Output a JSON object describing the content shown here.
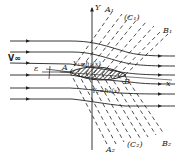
{
  "figure": {
    "labels": {
      "freestream": "V∞",
      "angle": "ε",
      "leading_edge": "A",
      "trailing_edge": "B",
      "x_axis": "x",
      "y_axis": "Y",
      "upper_surface": "Y₁=h₁(x)",
      "lower_surface": "Y₂=h₂(x)",
      "upper_front_char": "A₁",
      "upper_family": "(C₁)",
      "upper_rear_char": "B₁",
      "lower_front_char": "A₂",
      "lower_family": "(C₂)",
      "lower_rear_char": "B₂"
    },
    "colors": {
      "ink": "#222222",
      "background": "#ffffff"
    }
  }
}
